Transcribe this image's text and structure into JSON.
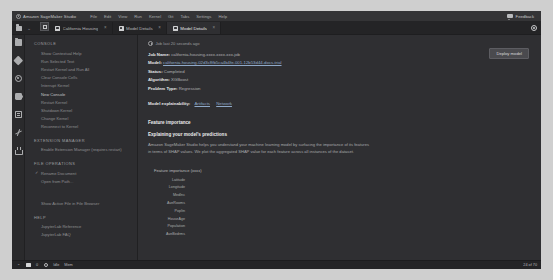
{
  "app": {
    "brand": "Amazon SageMaker Studio",
    "menu": [
      "File",
      "Edit",
      "View",
      "Run",
      "Kernel",
      "Git",
      "Tabs",
      "Settings",
      "Help"
    ],
    "feedback_label": "Feedback",
    "feedback_icon": "speech-bubble-icon",
    "settings_icon": "gear-icon"
  },
  "tabs": [
    {
      "label": "California Housing",
      "icon": "notebook-icon",
      "active": false
    },
    {
      "label": "Model Details",
      "icon": "model-icon",
      "active": false
    },
    {
      "label": "Model Details",
      "icon": "model-icon",
      "active": true
    }
  ],
  "rail": {
    "items": [
      {
        "name": "file-browser-icon",
        "glyph": "folder"
      },
      {
        "name": "git-icon",
        "glyph": "diamond"
      },
      {
        "name": "running-terminals-icon",
        "glyph": "circle"
      },
      {
        "name": "extensions-icon",
        "glyph": "puzzle"
      },
      {
        "name": "open-tabs-icon",
        "glyph": "files"
      },
      {
        "name": "sagemaker-components-icon",
        "glyph": "ml"
      },
      {
        "name": "experiments-icon",
        "glyph": "flask"
      }
    ]
  },
  "panel": {
    "sections": [
      {
        "title": "CONSOLE",
        "items": [
          {
            "label": "Show Contextual Help",
            "bright": false,
            "check": false
          },
          {
            "label": "Run Selected Text",
            "bright": false,
            "check": false
          },
          {
            "label": "Restart Kernel and Run All",
            "bright": false,
            "check": false
          },
          {
            "label": "Clear Console Cells",
            "bright": false,
            "check": false
          },
          {
            "label": "Interrupt Kernel",
            "bright": false,
            "check": false
          },
          {
            "label": "New Console",
            "bright": true,
            "check": false
          },
          {
            "label": "Restart Kernel",
            "bright": false,
            "check": false
          },
          {
            "label": "Shutdown Kernel",
            "bright": false,
            "check": false
          },
          {
            "label": "Change Kernel",
            "bright": false,
            "check": false
          },
          {
            "label": "Reconnect to Kernel",
            "bright": false,
            "check": false
          }
        ]
      },
      {
        "title": "EXTENSION MANAGER",
        "items": [
          {
            "label": "Enable Extension Manager (requires restart)",
            "bright": false,
            "check": false
          }
        ]
      },
      {
        "title": "FILE OPERATIONS",
        "items": [
          {
            "label": "Rename Document",
            "bright": false,
            "check": true
          },
          {
            "label": "Open from Path...",
            "bright": false,
            "check": false
          }
        ]
      }
    ],
    "standalone": {
      "label": "Show Active File in File Browser"
    },
    "help": {
      "title": "HELP",
      "items": [
        {
          "label": "JupyterLab Reference"
        },
        {
          "label": "JupyterLab FAQ"
        }
      ]
    }
  },
  "main": {
    "timestamp": "Job last 20 seconds ago",
    "primary_button": "Deploy model",
    "details": [
      {
        "key": "Job Name:",
        "value": "california-housing-xxxx-xxxx-xxx-job"
      },
      {
        "key": "Model:",
        "value": "california-housing-02d3c8fb5ca4b4fe-001-12b53d44-docs-trial",
        "link": true
      },
      {
        "key": "Status:",
        "value": "Completed"
      },
      {
        "key": "Algorithm:",
        "value": "XGBoost"
      },
      {
        "key": "Problem Type:",
        "value": "Regression"
      }
    ],
    "explainability": {
      "key": "Model explainability:",
      "links": [
        "Artifacts",
        "Network"
      ]
    },
    "feature_importance_header": "Feature importance",
    "explain_head": "Explaining your model's predictions",
    "explain_body": "Amazon SageMaker Studio helps you understand your machine learning model by surfacing the importance of its features in terms of SHAP values. We plot the aggregated SHAP value for each feature across all instances of the dataset.",
    "chart_title": "Feature importance (xxxx)"
  },
  "chart_data": {
    "type": "bar",
    "orientation": "horizontal",
    "title": "Feature importance (xxxx)",
    "xlabel": "",
    "ylabel": "",
    "categories": [
      "Latitude",
      "Longitude",
      "MedInc",
      "AveRooms",
      "Popltn",
      "HouseAge",
      "Population",
      "AveBedrms"
    ],
    "values": [
      100.0,
      78.5,
      46.5,
      44.5,
      31.0,
      28.0,
      24.0,
      16.5
    ],
    "value_unit": "relative-importance",
    "xlim": [
      0,
      100
    ],
    "grid": false,
    "bar_color": "#d6d7d9",
    "background": "#2f2f32"
  },
  "statusbar": {
    "items": [
      {
        "name": "menu-icon",
        "glyph": "caret"
      },
      {
        "name": "notebook-status-icon",
        "glyph": "box"
      },
      {
        "name": "terminals-count",
        "glyph": "text",
        "label": "0"
      },
      {
        "name": "kernel-status-icon",
        "glyph": "circle"
      },
      {
        "name": "kernel-label",
        "glyph": "text",
        "label": "Idle"
      },
      {
        "name": "mode-label",
        "glyph": "text",
        "label": "Mem"
      }
    ],
    "right": [
      {
        "name": "position-label",
        "label": "24 of 70"
      }
    ]
  }
}
